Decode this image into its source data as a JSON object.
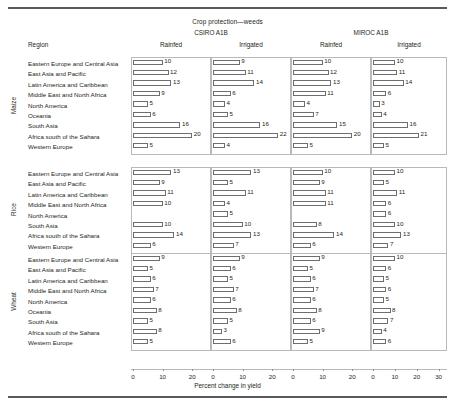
{
  "figure": {
    "title": "Crop protection—weeds",
    "region_header": "Region",
    "axis_title": "Percent change in yield",
    "models": [
      "CSIRO A1B",
      "MIROC A1B"
    ],
    "column_headers": [
      "Rainfed",
      "Irrigated",
      "Rainfed",
      "Irrigated"
    ],
    "crop_labels": [
      "Maize",
      "Rice",
      "Wheat"
    ]
  },
  "chart_data": {
    "type": "bar",
    "title": "Crop protection—weeds",
    "xlabel": "Percent change in yield",
    "ylabel": "",
    "orientation": "horizontal",
    "grid": false,
    "legend": "none",
    "panel_columns": [
      {
        "model": "CSIRO A1B",
        "condition": "Rainfed",
        "xlim": [
          0,
          25
        ],
        "ticks": [
          0,
          10,
          20
        ]
      },
      {
        "model": "CSIRO A1B",
        "condition": "Irrigated",
        "xlim": [
          0,
          25
        ],
        "ticks": [
          0,
          10,
          20
        ]
      },
      {
        "model": "MIROC A1B",
        "condition": "Rainfed",
        "xlim": [
          0,
          25
        ],
        "ticks": [
          0,
          10,
          20
        ]
      },
      {
        "model": "MIROC A1B",
        "condition": "Irrigated",
        "xlim": [
          0,
          32
        ],
        "ticks": [
          0,
          10,
          20,
          30
        ]
      }
    ],
    "panels": [
      {
        "crop": "Maize",
        "categories": [
          "Eastern Europe and Central Asia",
          "East Asia and Pacific",
          "Latin America and Caribbean",
          "Middle East and North Africa",
          "North America",
          "Oceania",
          "South Asia",
          "Africa south of the Sahara",
          "Western Europe"
        ],
        "series": [
          {
            "name": "CSIRO A1B Rainfed",
            "values": [
              10,
              12,
              13,
              9,
              5,
              6,
              16,
              20,
              5
            ]
          },
          {
            "name": "CSIRO A1B Irrigated",
            "values": [
              9,
              11,
              14,
              6,
              4,
              5,
              16,
              22,
              4
            ]
          },
          {
            "name": "MIROC A1B Rainfed",
            "values": [
              10,
              12,
              13,
              11,
              4,
              7,
              15,
              20,
              5
            ]
          },
          {
            "name": "MIROC A1B Irrigated",
            "values": [
              10,
              11,
              14,
              6,
              3,
              4,
              16,
              21,
              5
            ]
          }
        ]
      },
      {
        "crop": "Rice",
        "categories": [
          "Eastern Europe and Central Asia",
          "East Asia and Pacific",
          "Latin America and Caribbean",
          "Middle East and North Africa",
          "North America",
          "South Asia",
          "Africa south of the Sahara",
          "Western Europe"
        ],
        "series": [
          {
            "name": "CSIRO A1B Rainfed",
            "values": [
              13,
              9,
              11,
              10,
              null,
              10,
              14,
              6
            ]
          },
          {
            "name": "CSIRO A1B Irrigated",
            "values": [
              13,
              5,
              11,
              4,
              5,
              10,
              13,
              7
            ]
          },
          {
            "name": "MIROC A1B Rainfed",
            "values": [
              10,
              9,
              11,
              11,
              null,
              8,
              14,
              6
            ]
          },
          {
            "name": "MIROC A1B Irrigated",
            "values": [
              10,
              5,
              11,
              6,
              6,
              10,
              13,
              7
            ]
          }
        ]
      },
      {
        "crop": "Wheat",
        "categories": [
          "Eastern Europe and Central Asia",
          "East Asia and Pacific",
          "Latin America and Caribbean",
          "Middle East and North Africa",
          "North America",
          "Oceania",
          "South Asia",
          "Africa south of the Sahara",
          "Western Europe"
        ],
        "series": [
          {
            "name": "CSIRO A1B Rainfed",
            "values": [
              9,
              5,
              6,
              7,
              6,
              8,
              5,
              8,
              5
            ]
          },
          {
            "name": "CSIRO A1B Irrigated",
            "values": [
              9,
              6,
              5,
              7,
              6,
              8,
              5,
              3,
              6
            ]
          },
          {
            "name": "MIROC A1B Rainfed",
            "values": [
              9,
              5,
              6,
              7,
              6,
              8,
              6,
              9,
              5
            ]
          },
          {
            "name": "MIROC A1B Irrigated",
            "values": [
              10,
              6,
              5,
              6,
              5,
              8,
              7,
              4,
              6
            ]
          }
        ]
      }
    ]
  },
  "colors": {
    "bar_outline": "#6d6e71",
    "bar_fill": "#ffffff",
    "panel_border": "#b9babc",
    "rule": "#58595b",
    "text": "#231f20"
  }
}
